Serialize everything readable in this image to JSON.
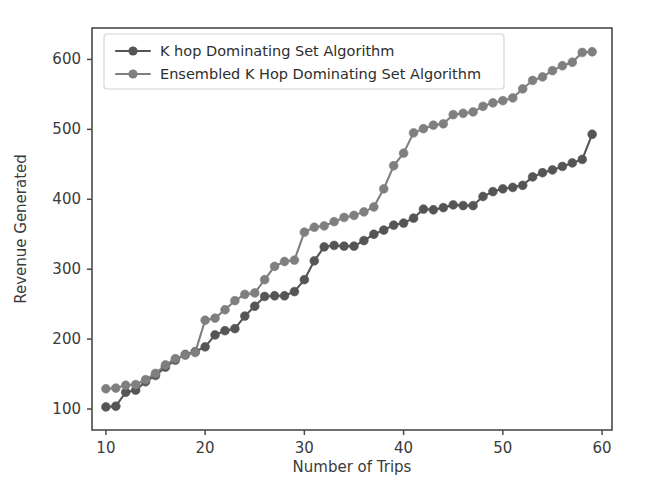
{
  "chart_data": {
    "type": "line",
    "title": "",
    "xlabel": "Number of Trips",
    "ylabel": "Revenue Generated",
    "xlim": [
      8.6,
      61.0
    ],
    "ylim": [
      70,
      645
    ],
    "xticks": [
      10,
      20,
      30,
      40,
      50,
      60
    ],
    "yticks": [
      100,
      200,
      300,
      400,
      500,
      600
    ],
    "grid": false,
    "legend_position": "upper-left",
    "marker": "circle",
    "x": [
      10,
      11,
      12,
      13,
      14,
      15,
      16,
      17,
      18,
      19,
      20,
      21,
      22,
      23,
      24,
      25,
      26,
      27,
      28,
      29,
      30,
      31,
      32,
      33,
      34,
      35,
      36,
      37,
      38,
      39,
      40,
      41,
      42,
      43,
      44,
      45,
      46,
      47,
      48,
      49,
      50,
      51,
      52,
      53,
      54,
      55,
      56,
      57,
      58,
      59
    ],
    "series": [
      {
        "name": "K hop Dominating Set Algorithm",
        "color": "#555555",
        "values": [
          103,
          104,
          124,
          127,
          139,
          148,
          160,
          170,
          178,
          182,
          189,
          206,
          212,
          215,
          233,
          247,
          261,
          262,
          262,
          268,
          285,
          312,
          332,
          334,
          333,
          333,
          341,
          350,
          356,
          363,
          366,
          373,
          386,
          385,
          388,
          392,
          391,
          391,
          404,
          411,
          415,
          417,
          420,
          432,
          438,
          442,
          447,
          452,
          457,
          493
        ]
      },
      {
        "name": "Ensembled K Hop Dominating Set Algorithm",
        "color": "#7f7f7f",
        "values": [
          129,
          130,
          134,
          135,
          142,
          151,
          163,
          172,
          177,
          181,
          227,
          230,
          242,
          255,
          264,
          266,
          285,
          304,
          311,
          313,
          353,
          360,
          362,
          368,
          374,
          377,
          382,
          389,
          415,
          448,
          466,
          495,
          501,
          506,
          508,
          521,
          523,
          525,
          533,
          538,
          541,
          545,
          558,
          570,
          575,
          584,
          591,
          596,
          610,
          611
        ]
      }
    ]
  },
  "legend": {
    "entries": [
      "K hop Dominating Set Algorithm",
      "Ensembled K Hop Dominating Set Algorithm"
    ]
  },
  "axes": {
    "xlabel": "Number of Trips",
    "ylabel": "Revenue Generated",
    "xtick_labels": [
      "10",
      "20",
      "30",
      "40",
      "50",
      "60"
    ],
    "ytick_labels": [
      "100",
      "200",
      "300",
      "400",
      "500",
      "600"
    ]
  }
}
